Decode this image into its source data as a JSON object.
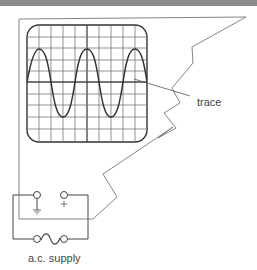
{
  "diagram": {
    "labels": {
      "trace": "trace",
      "supply": "a.c. supply"
    },
    "terminals": {
      "earth_symbol": "earth-ground",
      "positive_symbol": "+"
    },
    "screen": {
      "grid_columns": 10,
      "grid_rows": 10,
      "waveform": "sine",
      "cycles_visible": 2.5
    },
    "colors": {
      "line": "#555555",
      "wave": "#333333",
      "grid": "#777777",
      "band": "#8a8a8a"
    }
  }
}
